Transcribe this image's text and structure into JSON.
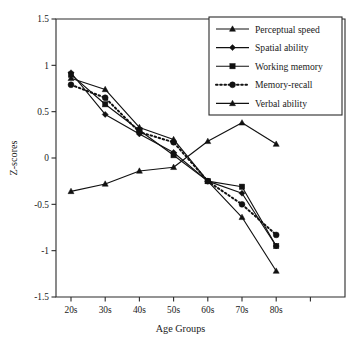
{
  "chart_data": {
    "type": "line",
    "title": "",
    "xlabel": "Age Groups",
    "ylabel": "Z-scores",
    "categories": [
      "20s",
      "30s",
      "40s",
      "50s",
      "60s",
      "70s",
      "80s"
    ],
    "ylim": [
      -1.5,
      1.5
    ],
    "yticks": [
      1.5,
      1,
      0.5,
      0,
      -0.5,
      -1,
      -1.5
    ],
    "ytick_labels": [
      "1.5",
      "1",
      "0.5",
      "0",
      "-0.5",
      "-1",
      "-1.5"
    ],
    "grid": false,
    "legend_position": "top-right",
    "series": [
      {
        "name": "Perceptual speed",
        "marker": "triangle",
        "line_style": "solid",
        "values": [
          0.86,
          0.74,
          0.33,
          0.2,
          -0.25,
          -0.64,
          -1.22
        ]
      },
      {
        "name": "Spatial ability",
        "marker": "diamond",
        "line_style": "solid",
        "values": [
          0.92,
          0.47,
          0.26,
          0.06,
          -0.25,
          -0.38,
          -0.95
        ]
      },
      {
        "name": "Working memory",
        "marker": "square",
        "line_style": "solid",
        "values": [
          0.9,
          0.58,
          0.3,
          0.03,
          -0.25,
          -0.31,
          -0.95
        ]
      },
      {
        "name": "Memory-recall",
        "marker": "circle",
        "line_style": "dotted",
        "values": [
          0.79,
          0.65,
          0.28,
          0.17,
          -0.25,
          -0.5,
          -0.83
        ]
      },
      {
        "name": "Verbal ability",
        "marker": "triangle",
        "line_style": "solid",
        "values": [
          -0.36,
          -0.28,
          -0.14,
          -0.1,
          0.18,
          0.38,
          0.15
        ]
      }
    ]
  },
  "legend": {
    "items": [
      {
        "label": "Perceptual speed"
      },
      {
        "label": "Spatial ability"
      },
      {
        "label": "Working memory"
      },
      {
        "label": "Memory-recall"
      },
      {
        "label": "Verbal ability"
      }
    ]
  },
  "colors": {
    "ink": "#111111",
    "axis": "#2b2b2b",
    "background": "#ffffff"
  }
}
